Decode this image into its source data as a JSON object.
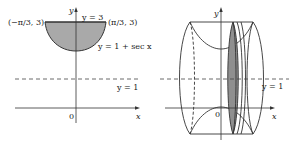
{
  "left_panel": {
    "axis_x_label": "x",
    "axis_y_label": "y",
    "origin_label": "0",
    "top_line_label": "y = 3",
    "curve_label": "y = 1 + sec x",
    "dashed_line_label": "y = 1",
    "left_point_label": "(−π/3, 3)",
    "right_point_label": "(π/3, 3)",
    "region_fill": "#a9a9a9"
  },
  "right_panel": {
    "axis_x_label": "x",
    "axis_y_label": "y",
    "origin_label": "0",
    "dashed_line_label": "y = 1",
    "washer_fill": "#8f8f8f"
  },
  "colors": {
    "stroke": "#333333",
    "background": "#ffffff"
  }
}
